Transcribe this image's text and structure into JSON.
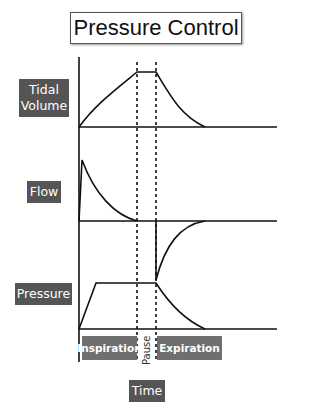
{
  "title": "Pressure Control",
  "labels": {
    "tidal_volume": "Tidal\nVolume",
    "tidal_line1": "Tidal",
    "tidal_line2": "Volume",
    "flow": "Flow",
    "pressure": "Pressure",
    "time": "Time"
  },
  "phases": {
    "inspiration": "Inspiration",
    "pause": "Pause",
    "expiration": "Expiration"
  },
  "colors": {
    "label_bg": "#555555",
    "phase_bg": "#6f6f6f",
    "curve": "#111111"
  }
}
